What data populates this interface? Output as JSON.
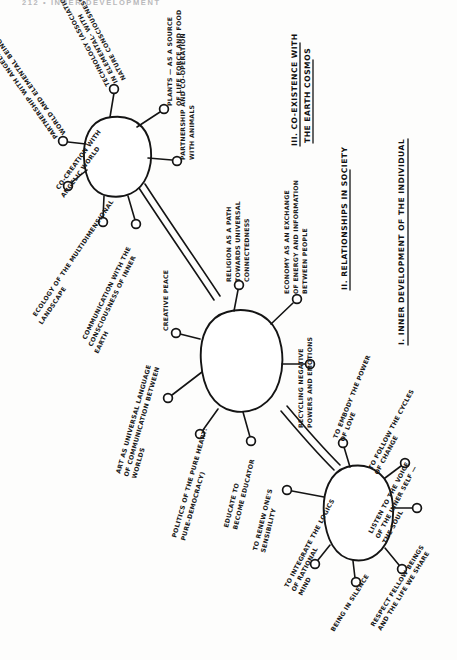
{
  "page": {
    "running_head": "212  •  INNER DEVELOPMENT",
    "width": 457,
    "height": 660,
    "ink_color": "#141414",
    "paper_color": "#fdfdfc"
  },
  "diagram": {
    "type": "hand-drawn-mind-map",
    "orientation": "rotated-90-counterclockwise",
    "node_count": 3,
    "headings": [
      {
        "id": "heading-3",
        "text_line1": "III. CO-EXISTENCE WITH",
        "text_line2": "THE EARTH COSMOS"
      },
      {
        "id": "heading-2",
        "text_line1": "II. RELATIONSHIPS IN SOCIETY",
        "text_line2": ""
      },
      {
        "id": "heading-1",
        "text_line1": "I. INNER DEVELOPMENT OF THE INDIVIDUAL",
        "text_line2": ""
      }
    ],
    "clusters": [
      {
        "id": "cluster-earth-cosmos",
        "heading": "III. CO-EXISTENCE WITH THE EARTH COSMOS",
        "branches": [
          {
            "id": "branch-partnership-angelic",
            "lines": [
              "PARTNERSHIP WITH ANGELIC",
              "WORLD AND ELEMENTAL BEINGS"
            ]
          },
          {
            "id": "branch-technology-nature",
            "lines": [
              "TECHNOLOGY (ASSOCIATION)",
              "IN ELEMENTAL- WITH",
              "NATURE CONSCIOUSNESS OF"
            ]
          },
          {
            "id": "branch-plants",
            "lines": [
              "PLANTS — AS A SOURCE",
              "OF LIFE FORCE AND FOOD"
            ]
          },
          {
            "id": "branch-animals",
            "lines": [
              "PARTNERSHIP AND CO-OPERATION",
              "WITH ANIMALS"
            ]
          },
          {
            "id": "branch-co-creation-angelic",
            "lines": [
              "CO-CREATION WITH",
              "ANGELIC WORLD"
            ]
          },
          {
            "id": "branch-multidimensional-ecology",
            "lines": [
              "ECOLOGY OF THE MULTIDIMENSIONAL",
              "LANDSCAPE"
            ]
          },
          {
            "id": "branch-inner-earth",
            "lines": [
              "COMMUNICATION WITH THE",
              "CONSCIOUSNESS OF INNER",
              "EARTH"
            ]
          }
        ]
      },
      {
        "id": "cluster-society",
        "heading": "II. RELATIONSHIPS IN SOCIETY",
        "branches": [
          {
            "id": "branch-religion",
            "lines": [
              "RELIGION AS A PATH",
              "TOWARDS UNIVERSAL",
              "CONNECTEDNESS"
            ]
          },
          {
            "id": "branch-economy",
            "lines": [
              "ECONOMY AS AN EXCHANGE",
              "OF ENERGY AND INFORMATION",
              "BETWEEN PEOPLE"
            ]
          },
          {
            "id": "branch-recycling",
            "lines": [
              "RECYCLING NEGATIVE",
              "POWERS AND EMOTIONS"
            ]
          },
          {
            "id": "branch-creative-peace",
            "lines": [
              "CREATIVE PEACE"
            ]
          },
          {
            "id": "branch-art-language",
            "lines": [
              "ART AS UNIVERSAL LANGUAGE",
              "OF COMMUNICATION BETWEEN",
              "WORLDS"
            ]
          },
          {
            "id": "branch-politics-pure-heart",
            "lines": [
              "POLITICS OF THE PURE HEART:",
              "PURE-DEMOCRACY)"
            ]
          },
          {
            "id": "branch-educate",
            "lines": [
              "EDUCATE TO",
              "BECOME EDUCATOR"
            ]
          }
        ]
      },
      {
        "id": "cluster-individual",
        "heading": "I. INNER DEVELOPMENT OF THE INDIVIDUAL",
        "branches": [
          {
            "id": "branch-embody-love",
            "lines": [
              "TO EMBODY THE POWER",
              "OF LOVE"
            ]
          },
          {
            "id": "branch-cycles-change",
            "lines": [
              "TO FOLLOW THE CYCLES",
              "OF CHANGE"
            ]
          },
          {
            "id": "branch-listen-soul",
            "lines": [
              "LISTEN TO THE VOICE",
              "OF THE INNER SELF —",
              "THE SOUL"
            ]
          },
          {
            "id": "branch-renew-sensibility",
            "lines": [
              "TO RENEW ONE'S",
              "SENSIBILITY"
            ]
          },
          {
            "id": "branch-integrate-logics",
            "lines": [
              "TO INTEGRATE THE LOGICS",
              "OF RATIONAL",
              "MIND"
            ]
          },
          {
            "id": "branch-being-silence",
            "lines": [
              "BEING IN SILENCE"
            ]
          },
          {
            "id": "branch-respect-fellow",
            "lines": [
              "RESPECT FELLOW BEINGS",
              "AND THE LIFE WE SHARE"
            ]
          }
        ]
      }
    ]
  }
}
